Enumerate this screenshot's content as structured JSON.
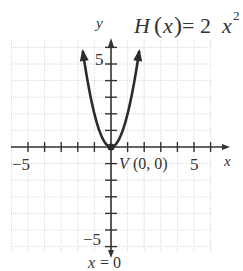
{
  "chart_data": {
    "type": "line",
    "function_label": {
      "name": "H",
      "arg": "x",
      "expr_coeff": "2",
      "expr_var": "x",
      "expr_exp": "2"
    },
    "xlabel": "x",
    "ylabel": "y",
    "xlim": [
      -6,
      6
    ],
    "ylim": [
      -6,
      6
    ],
    "grid": true,
    "x_tick_labels": [
      {
        "value": -5,
        "text": "−5"
      },
      {
        "value": 5,
        "text": "5"
      }
    ],
    "y_tick_labels": [
      {
        "value": 5,
        "text": "5"
      },
      {
        "value": -5,
        "text": "−5"
      }
    ],
    "series": [
      {
        "name": "H(x) = 2x^2",
        "x": [
          -1.75,
          -1.5,
          -1,
          -0.5,
          0,
          0.5,
          1,
          1.5,
          1.75
        ],
        "y": [
          6.125,
          4.5,
          2,
          0.5,
          0,
          0.5,
          2,
          4.5,
          6.125
        ]
      }
    ],
    "annotations": [
      {
        "text": "V (0, 0)",
        "x": 0,
        "y": 0,
        "label": "vertex"
      },
      {
        "text": "x = 0",
        "label": "axis of symmetry"
      }
    ]
  },
  "labels": {
    "y_axis": "y",
    "x_axis": "x",
    "func_H": "H",
    "func_paren_open": "(",
    "func_x": "x",
    "func_paren_close": ")",
    "func_eq": "= 2",
    "func_var": "x",
    "func_exp": "2",
    "x_tick_neg5": "−5",
    "x_tick_5": "5",
    "y_tick_5": "5",
    "y_tick_neg5": "−5",
    "vertex_V": "V",
    "vertex_coords": "(0, 0)",
    "symmetry_x": "x",
    "symmetry_eq": " = 0"
  },
  "colors": {
    "grid": "#c8c8c8",
    "axis": "#333333",
    "curve": "#2b2b2b"
  }
}
